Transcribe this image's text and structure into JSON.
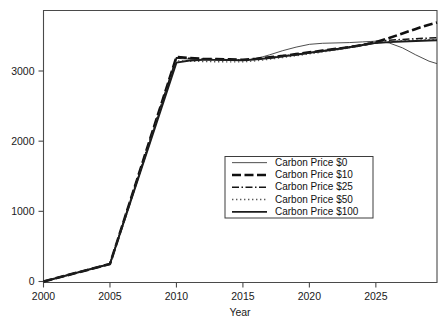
{
  "chart_data": {
    "type": "line",
    "title": "",
    "xlabel": "Year",
    "ylabel": "",
    "xlim": [
      2000,
      2029.6
    ],
    "ylim": [
      0,
      3900
    ],
    "grid": false,
    "legend_position": "center-right",
    "xticks": [
      2000,
      2005,
      2010,
      2015,
      2020,
      2025
    ],
    "xtick_labels": [
      "2000",
      "2005",
      "2010",
      "2015",
      "2020",
      "2025"
    ],
    "yticks": [
      0,
      1000,
      2000,
      3000
    ],
    "ytick_labels": [
      "0",
      "1000",
      "2000",
      "3000"
    ],
    "x": [
      2000,
      2005,
      2010,
      2011,
      2012,
      2013,
      2014,
      2015,
      2016,
      2017,
      2018,
      2019,
      2020,
      2021,
      2022,
      2023,
      2024,
      2025,
      2026,
      2027,
      2028,
      2029,
      2029.6
    ],
    "series": [
      {
        "name": "Carbon Price $0",
        "style": "thin-solid",
        "color": "#3a3a3a",
        "values": [
          0,
          250,
          3180,
          3170,
          3165,
          3160,
          3155,
          3155,
          3175,
          3230,
          3290,
          3340,
          3380,
          3395,
          3400,
          3405,
          3415,
          3425,
          3400,
          3330,
          3230,
          3140,
          3105
        ]
      },
      {
        "name": "Carbon Price $10",
        "style": "thick-dashed",
        "color": "#101010",
        "values": [
          0,
          250,
          3200,
          3185,
          3175,
          3170,
          3165,
          3160,
          3175,
          3195,
          3215,
          3240,
          3265,
          3290,
          3315,
          3340,
          3370,
          3410,
          3470,
          3535,
          3600,
          3660,
          3690
        ]
      },
      {
        "name": "Carbon Price $25",
        "style": "dash-dot",
        "color": "#141414",
        "values": [
          0,
          250,
          3190,
          3180,
          3172,
          3166,
          3160,
          3155,
          3170,
          3190,
          3212,
          3236,
          3262,
          3288,
          3314,
          3342,
          3375,
          3420,
          3440,
          3450,
          3460,
          3470,
          3475
        ]
      },
      {
        "name": "Carbon Price $50",
        "style": "dotted",
        "color": "#5a5a5a",
        "values": [
          0,
          250,
          3145,
          3140,
          3136,
          3132,
          3130,
          3130,
          3146,
          3168,
          3192,
          3218,
          3244,
          3272,
          3300,
          3330,
          3362,
          3400,
          3420,
          3432,
          3440,
          3448,
          3452
        ]
      },
      {
        "name": "Carbon Price $100",
        "style": "medium-solid",
        "color": "#1c1c1c",
        "values": [
          0,
          250,
          3120,
          3150,
          3158,
          3158,
          3156,
          3152,
          3166,
          3186,
          3208,
          3232,
          3258,
          3284,
          3310,
          3338,
          3370,
          3400,
          3412,
          3420,
          3428,
          3434,
          3438
        ]
      }
    ]
  },
  "legend": {
    "entries": [
      {
        "label": "Carbon Price $0"
      },
      {
        "label": "Carbon Price $10"
      },
      {
        "label": "Carbon Price $25"
      },
      {
        "label": "Carbon Price $50"
      },
      {
        "label": "Carbon Price $100"
      }
    ]
  },
  "colors": {
    "axis": "#4a4a4a",
    "text": "#111111",
    "background": "#ffffff",
    "legend_border": "#3d3d3d"
  }
}
